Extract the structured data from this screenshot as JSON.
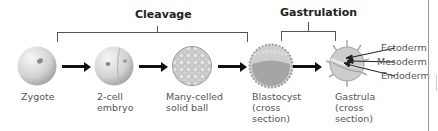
{
  "phases": {
    "cleavage": "Cleavage",
    "gastrulation": "Gastrulation"
  },
  "stages": [
    {
      "id": "zygote",
      "label": "Zygote"
    },
    {
      "id": "two-cell",
      "label": "2-cell\nembryo"
    },
    {
      "id": "many-celled",
      "label": "Many-celled\nsolid ball"
    },
    {
      "id": "blastocyst",
      "label": "Blastocyst\n(cross\nsection)"
    },
    {
      "id": "gastrula",
      "label": "Gastrula\n(cross\nsection)"
    }
  ],
  "germ_layers": [
    "Ectoderm",
    "Mesoderm",
    "Endoderm"
  ],
  "colors": {
    "cell_fill": "#d9d9d9",
    "blastocyst_core": "#a8a8a8",
    "arrow": "#111111",
    "bracket": "#555555"
  }
}
